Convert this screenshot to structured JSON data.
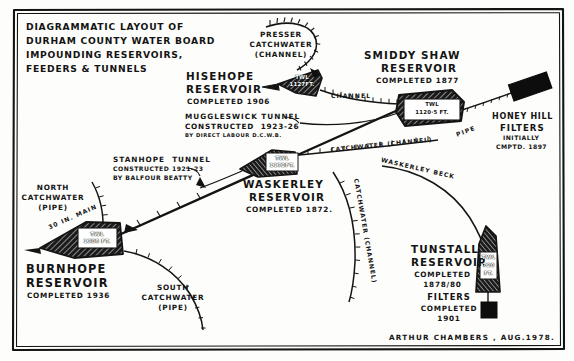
{
  "title": {
    "line1": "DIAGRAMMATIC LAYOUT OF",
    "line2": "DURHAM COUNTY WATER BOARD",
    "line3": "IMPOUNDING RESERVOIRS,",
    "line4": "FEEDERS & TUNNELS"
  },
  "signature": "ARTHUR CHAMBERS , AUG.1978.",
  "reservoirs": [
    {
      "id": "hisehope",
      "name_line1": "HISEHOPE",
      "name_line2": "RESERVOIR",
      "completed": "COMPLETED 1906",
      "twl_label": "TWL",
      "twl_value": "1127FT."
    },
    {
      "id": "smiddy-shaw",
      "name_line1": "SMIDDY SHAW",
      "name_line2": "RESERVOIR",
      "completed": "COMPLETED 1877",
      "twl_label": "TWL",
      "twl_value": "1120·5 FT."
    },
    {
      "id": "waskerley",
      "name_line1": "WASKERLEY",
      "name_line2": "RESERVOIR",
      "completed": "COMPLETED 1872.",
      "twl_label": "TWL",
      "twl_value": "1172FT."
    },
    {
      "id": "burnhope",
      "name_line1": "BURNHOPE",
      "name_line2": "RESERVOIR",
      "completed": "COMPLETED 1936",
      "twl_label": "TWL",
      "twl_value": "1305 FT."
    },
    {
      "id": "tunstall",
      "name_line1": "TUNSTALL",
      "name_line2": "RESERVOIR",
      "completed_line1": "COMPLETED",
      "completed_line2": "1878/80",
      "twl_label": "TWL",
      "twl_value1": "720",
      "twl_value2": "FT.",
      "filters_line1": "FILTERS",
      "filters_line2": "COMPLETED",
      "filters_line3": "1901"
    }
  ],
  "filters": {
    "honey_hill_line1": "HONEY HILL",
    "honey_hill_line2": "FILTERS",
    "honey_hill_line3": "INITIALLY",
    "honey_hill_line4": "CMPTD. 1897"
  },
  "tunnels": [
    {
      "id": "muggleswick",
      "line1": "MUGGLESWICK TUNNEL",
      "line2": "CONSTRUCTED  1923-26",
      "line3": "BY DIRECT LABOUR D.C.W.B."
    },
    {
      "id": "stanhope",
      "line1": "STANHOPE  TUNNEL",
      "line2": "CONSTRUCTED 1921-23",
      "line3": "BY BALFOUR BEATTY"
    }
  ],
  "feeders": {
    "presser_line1": "PRESSER",
    "presser_line2": "CATCHWATER",
    "presser_line3": "(CHANNEL)",
    "north_line1": "NORTH",
    "north_line2": "CATCHWATER",
    "north_line3": "(PIPE)",
    "south_line1": "SOUTH",
    "south_line2": "CATCHWATER",
    "south_line3": "(PIPE)",
    "channel": "CHANNEL",
    "catchwater_channel": "CATCHWATER (CHANNEL)",
    "catchwater_channel_vertical": "CATCHWATER (CHANNEL)",
    "waskerley_beck": "WASKERLEY BECK",
    "pipe": "PIPE",
    "main_30in": "30 IN. MAIN"
  },
  "colors": {
    "ink": "#141414",
    "paper": "#fdfdfb",
    "fill": "#2a2a2a"
  }
}
